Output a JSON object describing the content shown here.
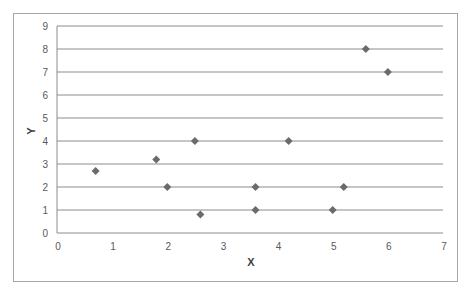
{
  "chart_data": {
    "type": "scatter",
    "title": "",
    "xlabel": "X",
    "ylabel": "Y",
    "xlim": [
      0,
      7
    ],
    "ylim": [
      0,
      9
    ],
    "x_ticks": [
      "0",
      "1",
      "2",
      "3",
      "4",
      "5",
      "6",
      "7"
    ],
    "y_ticks": [
      "0",
      "1",
      "2",
      "3",
      "4",
      "5",
      "6",
      "7",
      "8",
      "9"
    ],
    "grid": {
      "horizontal": true,
      "vertical": false
    },
    "legend": null,
    "series": [
      {
        "name": "Y",
        "marker": "diamond",
        "color": "#6b6b6b",
        "points": [
          {
            "x": 0.7,
            "y": 2.7
          },
          {
            "x": 1.8,
            "y": 3.2
          },
          {
            "x": 2.0,
            "y": 2.0
          },
          {
            "x": 2.6,
            "y": 0.8
          },
          {
            "x": 2.5,
            "y": 4.0
          },
          {
            "x": 3.6,
            "y": 2.0
          },
          {
            "x": 3.6,
            "y": 1.0
          },
          {
            "x": 4.2,
            "y": 4.0
          },
          {
            "x": 5.0,
            "y": 1.0
          },
          {
            "x": 5.2,
            "y": 2.0
          },
          {
            "x": 5.6,
            "y": 8.0
          },
          {
            "x": 6.0,
            "y": 7.0
          }
        ]
      }
    ]
  },
  "colors": {
    "gridline": "#8c8c8c",
    "axis": "#8c8c8c",
    "border": "#a6a6a6",
    "marker": "#6b6b6b"
  }
}
